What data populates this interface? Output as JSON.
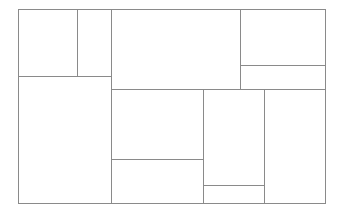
{
  "diagram": {
    "type": "treemap-partition",
    "stroke_color": "#8a8a8a",
    "background": "#ffffff",
    "bounds": {
      "x": 18,
      "y": 9,
      "w": 308,
      "h": 195
    },
    "cells": [
      {
        "id": "cell-1",
        "x": 18,
        "y": 9,
        "w": 60,
        "h": 68
      },
      {
        "id": "cell-2",
        "x": 77,
        "y": 9,
        "w": 35,
        "h": 68
      },
      {
        "id": "cell-3",
        "x": 18,
        "y": 76,
        "w": 94,
        "h": 128
      },
      {
        "id": "cell-4",
        "x": 111,
        "y": 9,
        "w": 130,
        "h": 81
      },
      {
        "id": "cell-5",
        "x": 240,
        "y": 9,
        "w": 86,
        "h": 57
      },
      {
        "id": "cell-6",
        "x": 240,
        "y": 65,
        "w": 86,
        "h": 25
      },
      {
        "id": "cell-7",
        "x": 111,
        "y": 89,
        "w": 93,
        "h": 71
      },
      {
        "id": "cell-8",
        "x": 111,
        "y": 159,
        "w": 93,
        "h": 45
      },
      {
        "id": "cell-9",
        "x": 203,
        "y": 89,
        "w": 62,
        "h": 97
      },
      {
        "id": "cell-10",
        "x": 203,
        "y": 185,
        "w": 62,
        "h": 19
      },
      {
        "id": "cell-11",
        "x": 264,
        "y": 89,
        "w": 62,
        "h": 115
      }
    ]
  }
}
